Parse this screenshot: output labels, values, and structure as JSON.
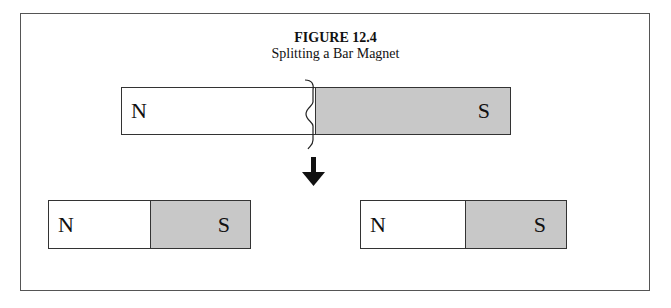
{
  "figure": {
    "title": "FIGURE 12.4",
    "subtitle": "Splitting a Bar Magnet"
  },
  "magnets": {
    "original": {
      "north_label": "N",
      "south_label": "S",
      "north_color": "#ffffff",
      "south_color": "#c8c8c8"
    },
    "left_piece": {
      "north_label": "N",
      "south_label": "S"
    },
    "right_piece": {
      "north_label": "N",
      "south_label": "S"
    }
  },
  "annotations": {
    "split_mark": "crack-line",
    "arrow": "down-arrow"
  }
}
